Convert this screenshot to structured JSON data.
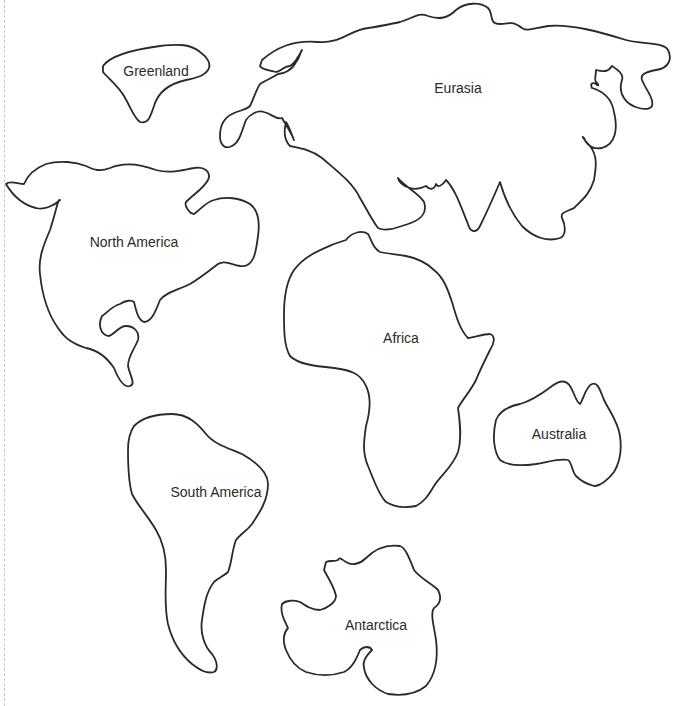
{
  "map": {
    "title": "",
    "style": {
      "background": "#ffffff",
      "outline_color": "#2a2a2a",
      "label_color": "#2b2b2b",
      "cut_line_color": "#c8c8c8"
    },
    "continents": [
      {
        "id": "greenland",
        "label": "Greenland"
      },
      {
        "id": "eurasia",
        "label": "Eurasia"
      },
      {
        "id": "north-america",
        "label": "North America"
      },
      {
        "id": "africa",
        "label": "Africa"
      },
      {
        "id": "australia",
        "label": "Australia"
      },
      {
        "id": "south-america",
        "label": "South America"
      },
      {
        "id": "antarctica",
        "label": "Antarctica"
      }
    ]
  }
}
